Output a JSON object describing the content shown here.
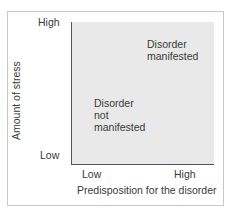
{
  "diagram": {
    "title": "",
    "y_axis": {
      "label": "Amount of stress",
      "high": "High",
      "low": "Low"
    },
    "x_axis": {
      "label": "Predisposition for the disorder",
      "low": "Low",
      "high": "High"
    },
    "regions": [
      {
        "lines": [
          "Disorder",
          "manifested"
        ]
      },
      {
        "lines": [
          "Disorder",
          "not",
          "manifested"
        ]
      }
    ],
    "colors": {
      "plot_bg": "#e9e9e9",
      "axis": "#555555",
      "frame": "#c8c8c8"
    }
  }
}
